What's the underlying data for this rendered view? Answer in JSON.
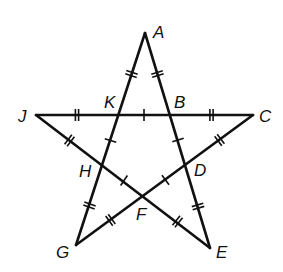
{
  "diagram": {
    "colors": {
      "line": "#111111",
      "background": "#ffffff"
    },
    "vertices": [
      {
        "id": "A",
        "label": "A",
        "x": 145,
        "y": 33,
        "lx": 153,
        "ly": 38
      },
      {
        "id": "C",
        "label": "C",
        "x": 253,
        "y": 115,
        "lx": 259,
        "ly": 122
      },
      {
        "id": "E",
        "label": "E",
        "x": 210,
        "y": 248,
        "lx": 216,
        "ly": 258
      },
      {
        "id": "G",
        "label": "G",
        "x": 76,
        "y": 245,
        "lx": 56,
        "ly": 258
      },
      {
        "id": "J",
        "label": "J",
        "x": 36,
        "y": 115,
        "lx": 18,
        "ly": 122
      }
    ],
    "intersections": [
      {
        "id": "K",
        "label": "K",
        "x": 118,
        "y": 115,
        "lx": 104,
        "ly": 108
      },
      {
        "id": "B",
        "label": "B",
        "x": 170,
        "y": 115,
        "lx": 174,
        "ly": 108
      },
      {
        "id": "D",
        "label": "D",
        "x": 186,
        "y": 165,
        "lx": 194,
        "ly": 176
      },
      {
        "id": "F",
        "label": "F",
        "x": 145,
        "y": 195,
        "lx": 136,
        "ly": 220
      },
      {
        "id": "H",
        "label": "H",
        "x": 103,
        "y": 166,
        "lx": 79,
        "ly": 177
      }
    ],
    "segments": [
      {
        "from": "J",
        "to": "C"
      },
      {
        "from": "A",
        "to": "G"
      },
      {
        "from": "A",
        "to": "E"
      },
      {
        "from": "J",
        "to": "E"
      },
      {
        "from": "C",
        "to": "G"
      }
    ],
    "tick_marks": {
      "single": [
        "KB",
        "BD",
        "DF",
        "FH",
        "HK"
      ],
      "double": [
        "AK",
        "AB",
        "BC",
        "CD",
        "DE",
        "EF",
        "FG",
        "GH",
        "HJ",
        "JK"
      ]
    },
    "labels": [
      "A",
      "B",
      "C",
      "D",
      "E",
      "F",
      "G",
      "H",
      "J",
      "K"
    ]
  }
}
